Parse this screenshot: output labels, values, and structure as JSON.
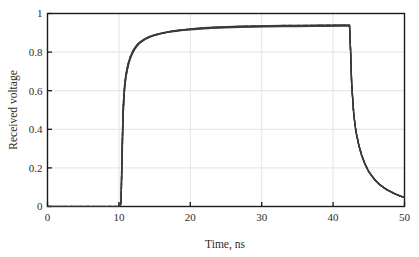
{
  "chart_data": {
    "type": "line",
    "title": "",
    "xlabel": "Time, ns",
    "ylabel": "Received voltage",
    "xlim": [
      0,
      50
    ],
    "ylim": [
      0,
      1
    ],
    "xticks": [
      0,
      10,
      20,
      30,
      40,
      50
    ],
    "yticks": [
      0,
      0.2,
      0.4,
      0.6,
      0.8,
      1
    ],
    "xtick_labels": [
      "0",
      "10",
      "20",
      "30",
      "40",
      "50"
    ],
    "ytick_labels": [
      "0",
      "0.2",
      "0.4",
      "0.6",
      "0.8",
      "1"
    ],
    "grid": true,
    "legend": "none",
    "line_color": "#3a3a3a",
    "grid_color": "#e3e3e3",
    "frame_color": "#1a1a1a",
    "series": [
      {
        "name": "trace-1",
        "x": [
          0,
          2,
          4,
          6,
          8,
          10,
          10.3,
          10.45,
          10.6,
          10.8,
          11.0,
          11.3,
          11.6,
          12.0,
          12.5,
          13.0,
          13.6,
          14.2,
          15.0,
          16.0,
          17.0,
          18.0,
          19.0,
          20.0,
          21.5,
          23.0,
          25.0,
          27.0,
          29.0,
          31.0,
          33.0,
          35.0,
          37.0,
          39.0,
          41.0,
          42.0,
          42.3,
          42.45,
          42.6,
          42.9,
          43.2,
          43.6,
          44.0,
          44.5,
          45.0,
          45.8,
          46.6,
          47.5,
          48.5,
          49.3,
          50.0
        ],
        "y": [
          0,
          0,
          0,
          0,
          0,
          0,
          0.02,
          0.28,
          0.5,
          0.62,
          0.68,
          0.735,
          0.772,
          0.805,
          0.833,
          0.851,
          0.866,
          0.877,
          0.887,
          0.896,
          0.903,
          0.908,
          0.912,
          0.9155,
          0.9195,
          0.9225,
          0.9255,
          0.928,
          0.9295,
          0.931,
          0.932,
          0.9325,
          0.933,
          0.9335,
          0.934,
          0.9342,
          0.934,
          0.8,
          0.63,
          0.47,
          0.385,
          0.315,
          0.263,
          0.215,
          0.179,
          0.139,
          0.11,
          0.087,
          0.068,
          0.055,
          0.046
        ]
      },
      {
        "name": "trace-2",
        "x": [
          0,
          2,
          4,
          6,
          8,
          10,
          10.3,
          10.45,
          10.6,
          10.8,
          11.0,
          11.3,
          11.6,
          12.0,
          12.5,
          13.0,
          13.6,
          14.2,
          15.0,
          16.0,
          17.0,
          18.0,
          19.0,
          20.0,
          21.5,
          23.0,
          25.0,
          27.0,
          29.0,
          31.0,
          33.0,
          35.0,
          37.0,
          39.0,
          41.0,
          42.0,
          42.3,
          42.45,
          42.6,
          42.9,
          43.2,
          43.6,
          44.0,
          44.5,
          45.0,
          45.8,
          46.6,
          47.5,
          48.5,
          49.3,
          50.0
        ],
        "y": [
          0,
          0,
          0,
          0,
          0,
          0,
          0.01,
          0.24,
          0.47,
          0.605,
          0.672,
          0.727,
          0.766,
          0.8,
          0.83,
          0.849,
          0.864,
          0.876,
          0.888,
          0.898,
          0.906,
          0.912,
          0.917,
          0.921,
          0.9255,
          0.929,
          0.932,
          0.9345,
          0.936,
          0.9375,
          0.9385,
          0.939,
          0.9395,
          0.94,
          0.9405,
          0.941,
          0.941,
          0.81,
          0.64,
          0.478,
          0.392,
          0.321,
          0.268,
          0.219,
          0.182,
          0.141,
          0.112,
          0.088,
          0.069,
          0.056,
          0.047
        ]
      },
      {
        "name": "trace-3",
        "x": [
          0,
          2,
          4,
          6,
          8,
          10,
          10.3,
          10.45,
          10.6,
          10.8,
          11.0,
          11.3,
          11.6,
          12.0,
          12.5,
          13.0,
          13.6,
          14.2,
          15.0,
          16.0,
          17.0,
          18.0,
          19.0,
          20.0,
          21.5,
          23.0,
          25.0,
          27.0,
          29.0,
          31.0,
          33.0,
          35.0,
          37.0,
          39.0,
          41.0,
          42.0,
          42.3,
          42.45,
          42.6,
          42.9,
          43.2,
          43.6,
          44.0,
          44.5,
          45.0,
          45.8,
          46.6,
          47.5,
          48.5,
          49.3,
          50.0
        ],
        "y": [
          0,
          0,
          0,
          0,
          0,
          0,
          0.03,
          0.32,
          0.53,
          0.637,
          0.692,
          0.744,
          0.779,
          0.811,
          0.838,
          0.855,
          0.869,
          0.88,
          0.89,
          0.899,
          0.906,
          0.911,
          0.915,
          0.918,
          0.9225,
          0.9255,
          0.9285,
          0.931,
          0.9325,
          0.934,
          0.935,
          0.9355,
          0.936,
          0.9365,
          0.937,
          0.9372,
          0.937,
          0.805,
          0.635,
          0.474,
          0.388,
          0.318,
          0.265,
          0.217,
          0.18,
          0.14,
          0.111,
          0.0875,
          0.0685,
          0.0555,
          0.0465
        ]
      },
      {
        "name": "trace-4-dashed",
        "x": [
          0,
          2,
          4,
          6,
          8,
          10,
          10.3,
          10.45,
          10.6,
          10.8,
          11.0,
          11.3,
          11.6,
          12.0,
          12.5,
          13.0,
          13.6,
          14.2,
          15.0,
          16.0,
          17.0,
          18.0,
          19.0,
          20.0,
          21.5,
          23.0,
          25.0,
          27.0,
          29.0,
          31.0,
          33.0,
          35.0,
          37.0,
          39.0,
          41.0,
          42.0,
          42.3,
          42.45,
          42.6,
          42.9,
          43.2,
          43.6,
          44.0,
          44.5,
          45.0,
          45.8,
          46.6,
          47.5,
          48.5,
          49.3,
          50.0
        ],
        "y": [
          0,
          0,
          0,
          0,
          0,
          0,
          0.015,
          0.26,
          0.485,
          0.615,
          0.678,
          0.731,
          0.769,
          0.803,
          0.831,
          0.85,
          0.865,
          0.8765,
          0.8875,
          0.897,
          0.9045,
          0.91,
          0.9145,
          0.9185,
          0.9235,
          0.927,
          0.9305,
          0.9332,
          0.9348,
          0.9362,
          0.9372,
          0.9378,
          0.9383,
          0.9388,
          0.9393,
          0.9396,
          0.9395,
          0.807,
          0.637,
          0.476,
          0.39,
          0.319,
          0.266,
          0.218,
          0.181,
          0.1405,
          0.1115,
          0.0878,
          0.0688,
          0.0558,
          0.0468
        ]
      },
      {
        "name": "trace-5-dashed",
        "x": [
          0,
          2,
          4,
          6,
          8,
          10,
          10.3,
          10.45,
          10.6,
          10.8,
          11.0,
          11.3,
          11.6,
          12.0,
          12.5,
          13.0,
          13.6,
          14.2,
          15.0,
          16.0,
          17.0,
          18.0,
          19.0,
          20.0,
          21.5,
          23.0,
          25.0,
          27.0,
          29.0,
          31.0,
          33.0,
          35.0,
          37.0,
          39.0,
          41.0,
          42.0,
          42.3,
          42.45,
          42.6,
          42.9,
          43.2,
          43.6,
          44.0,
          44.5,
          45.0,
          45.8,
          46.6,
          47.5,
          48.5,
          49.3,
          50.0
        ],
        "y": [
          0,
          0,
          0,
          0,
          0,
          0,
          0.025,
          0.3,
          0.515,
          0.628,
          0.686,
          0.74,
          0.776,
          0.808,
          0.835,
          0.853,
          0.8675,
          0.8785,
          0.8888,
          0.8982,
          0.9053,
          0.9107,
          0.9148,
          0.9185,
          0.9231,
          0.9264,
          0.9295,
          0.932,
          0.9336,
          0.935,
          0.936,
          0.9366,
          0.9371,
          0.9376,
          0.9381,
          0.9384,
          0.9383,
          0.804,
          0.634,
          0.473,
          0.387,
          0.317,
          0.264,
          0.216,
          0.1795,
          0.1395,
          0.1105,
          0.0872,
          0.0682,
          0.0552,
          0.0462
        ]
      }
    ]
  },
  "axes": {
    "ylabel_text": "Received voltage",
    "xlabel_text": "Time, ns"
  }
}
